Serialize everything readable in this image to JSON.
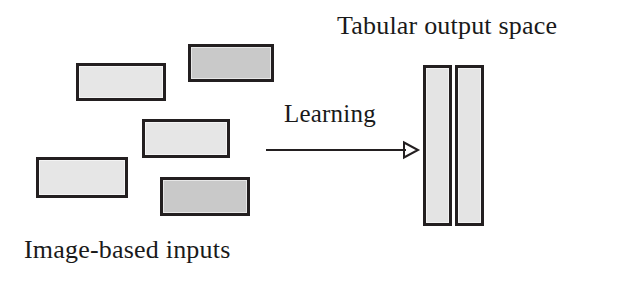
{
  "figure": {
    "width": 620,
    "height": 287,
    "background": "#ffffff"
  },
  "labels": {
    "input_group": "Image-based inputs",
    "output_group": "Tabular output space",
    "arrow": "Learning"
  },
  "colors": {
    "stroke": "#231f20",
    "patch_light": "#e6e6e6",
    "patch_dark": "#c9c9c9",
    "column_fill": "#e4e4e4",
    "text": "#1a1a1a",
    "background": "#ffffff"
  },
  "input_patches": [
    {
      "name": "patch-top-right-dark",
      "shade": "dark",
      "x": 188,
      "y": 44,
      "width": 86,
      "height": 38
    },
    {
      "name": "patch-upper-left",
      "shade": "light",
      "x": 76,
      "y": 63,
      "width": 90,
      "height": 38
    },
    {
      "name": "patch-middle",
      "shade": "light",
      "x": 142,
      "y": 119,
      "width": 88,
      "height": 39
    },
    {
      "name": "patch-lower-left",
      "shade": "light",
      "x": 36,
      "y": 157,
      "width": 92,
      "height": 41
    },
    {
      "name": "patch-lower-mid-dark",
      "shade": "dark",
      "x": 160,
      "y": 177,
      "width": 90,
      "height": 39
    }
  ],
  "output_columns": [
    {
      "name": "column-left",
      "x": 423,
      "y": 65,
      "width": 29,
      "height": 161
    },
    {
      "name": "column-right",
      "x": 455,
      "y": 65,
      "width": 29,
      "height": 161
    }
  ],
  "arrow": {
    "name": "learning-arrow",
    "from_x": 268,
    "to_x": 415,
    "y": 149,
    "head": "open-triangle",
    "stroke_width": 2
  }
}
